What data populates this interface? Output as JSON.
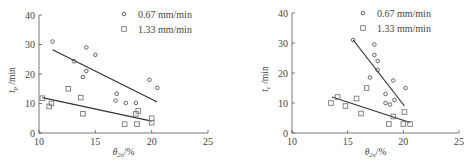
{
  "chart_data": [
    {
      "type": "scatter",
      "title": "",
      "xlabel": "θ2n/%",
      "ylabel": "tp/min",
      "xlim": [
        10,
        25
      ],
      "ylim": [
        0,
        40
      ],
      "xticks": [
        10,
        15,
        20,
        25
      ],
      "yticks": [
        0,
        10,
        20,
        30,
        40
      ],
      "grid": false,
      "legend_position": "top-right",
      "series": [
        {
          "name": "0.67 mm/min",
          "marker": "circle",
          "points": [
            [
              11.2,
              31
            ],
            [
              13.1,
              24.3
            ],
            [
              14.2,
              29
            ],
            [
              15.0,
              26.5
            ],
            [
              14.2,
              21
            ],
            [
              13.9,
              19
            ],
            [
              16.9,
              13.3
            ],
            [
              16.8,
              11
            ],
            [
              17.7,
              10.2
            ],
            [
              18.6,
              10.2
            ],
            [
              19.8,
              18
            ],
            [
              20.5,
              15.3
            ]
          ],
          "fit_line": [
            [
              11.2,
              28.2
            ],
            [
              20.5,
              10.5
            ]
          ]
        },
        {
          "name": "1.33 mm/min",
          "marker": "square",
          "points": [
            [
              10.3,
              11.8
            ],
            [
              10.9,
              9
            ],
            [
              11.1,
              10
            ],
            [
              12.6,
              15
            ],
            [
              13.7,
              12
            ],
            [
              13.9,
              6.5
            ],
            [
              17.6,
              3
            ],
            [
              18.7,
              3
            ],
            [
              18.6,
              6.5
            ],
            [
              18.8,
              7.5
            ],
            [
              20.0,
              5
            ],
            [
              20.0,
              3.5
            ]
          ],
          "fit_line": [
            [
              10.3,
              12
            ],
            [
              20.0,
              4
            ]
          ]
        }
      ]
    },
    {
      "type": "scatter",
      "title": "",
      "xlabel": "θ2n/%",
      "ylabel": "tc/min",
      "xlim": [
        10,
        25
      ],
      "ylim": [
        0,
        40
      ],
      "xticks": [
        10,
        15,
        20,
        25
      ],
      "yticks": [
        0,
        10,
        20,
        30,
        40
      ],
      "grid": false,
      "legend_position": "top-right",
      "series": [
        {
          "name": "0.67 mm/min",
          "marker": "circle",
          "points": [
            [
              15.5,
              31
            ],
            [
              17.4,
              29.5
            ],
            [
              17.4,
              26
            ],
            [
              17.7,
              24
            ],
            [
              17.7,
              21
            ],
            [
              17.0,
              18.5
            ],
            [
              19.1,
              17.5
            ],
            [
              20.2,
              15
            ],
            [
              18.4,
              13
            ],
            [
              18.4,
              10
            ],
            [
              18.8,
              9.5
            ],
            [
              19.2,
              11
            ]
          ],
          "fit_line": [
            [
              15.5,
              31
            ],
            [
              20.1,
              9
            ]
          ]
        },
        {
          "name": "1.33 mm/min",
          "marker": "square",
          "points": [
            [
              13.5,
              10
            ],
            [
              14.1,
              12
            ],
            [
              14.8,
              9
            ],
            [
              15.8,
              11.5
            ],
            [
              16.2,
              6.5
            ],
            [
              16.7,
              15
            ],
            [
              18.7,
              3
            ],
            [
              19.1,
              5.5
            ],
            [
              20.1,
              7
            ],
            [
              20.0,
              3
            ],
            [
              20.6,
              3
            ]
          ],
          "fit_line": [
            [
              13.6,
              12
            ],
            [
              20.6,
              3.5
            ]
          ]
        }
      ]
    }
  ],
  "panels": [
    {
      "ylabel_main": "t",
      "ylabel_sub": "p",
      "ylabel_unit": " /min",
      "xlabel_main": "θ",
      "xlabel_sub": "2n",
      "xlabel_unit": "/%",
      "legend": [
        "0.67 mm/min",
        "1.33 mm/min"
      ],
      "xtick_labels": [
        "10",
        "15",
        "20",
        "25"
      ],
      "ytick_labels": [
        "0",
        "10",
        "20",
        "30",
        "40"
      ]
    },
    {
      "ylabel_main": "t",
      "ylabel_sub": "c",
      "ylabel_unit": " /min",
      "xlabel_main": "θ",
      "xlabel_sub": "2n",
      "xlabel_unit": "/%",
      "legend": [
        "0.67 mm/min",
        "1.33 mm/min"
      ],
      "xtick_labels": [
        "10",
        "15",
        "20",
        "25"
      ],
      "ytick_labels": [
        "0",
        "10",
        "20",
        "30",
        "40"
      ]
    }
  ]
}
